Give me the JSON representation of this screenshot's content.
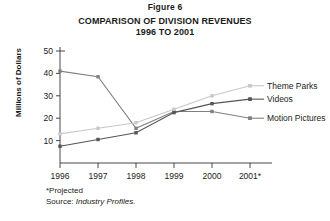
{
  "figure": {
    "label": "Figure 6",
    "title_line1": "COMPARISON OF DIVISION REVENUES",
    "title_line2": "1996 TO 2001"
  },
  "footnote": {
    "projected_note": "*Projected",
    "source_prefix": "Source: ",
    "source_name": "Industry Profiles."
  },
  "legend": {
    "theme_parks": "Theme Parks",
    "videos": "Videos",
    "motion_pictures": "Motion Pictures"
  },
  "axis": {
    "y_label": "Millions of Dollars",
    "y_ticks": [
      "50",
      "40",
      "30",
      "20",
      "10"
    ],
    "x_ticks": [
      "1996",
      "1997",
      "1998",
      "1999",
      "2000",
      "2001*"
    ]
  },
  "colors": {
    "motion_pictures": "#808080",
    "videos": "#555555",
    "theme_parks": "#c8c8c8",
    "axis": "#333333",
    "text": "#1a1a1a"
  },
  "chart_data": {
    "type": "line",
    "title": "COMPARISON OF DIVISION REVENUES 1996 TO 2001",
    "xlabel": "",
    "ylabel": "Millions of Dollars",
    "categories": [
      "1996",
      "1997",
      "1998",
      "1999",
      "2000",
      "2001*"
    ],
    "ylim": [
      0,
      50
    ],
    "yticks": [
      10,
      20,
      30,
      40,
      50
    ],
    "grid": false,
    "legend_position": "right-inline",
    "series": [
      {
        "name": "Motion Pictures",
        "values": [
          41,
          38.5,
          15.5,
          23,
          23,
          20
        ],
        "color": "#808080"
      },
      {
        "name": "Videos",
        "values": [
          7.5,
          10.5,
          13.5,
          22.5,
          26.5,
          28.5
        ],
        "color": "#555555"
      },
      {
        "name": "Theme Parks",
        "values": [
          13,
          15.5,
          18,
          24,
          30,
          34.5
        ],
        "color": "#c8c8c8"
      }
    ],
    "annotations": [
      "*Projected",
      "Source: Industry Profiles."
    ]
  }
}
